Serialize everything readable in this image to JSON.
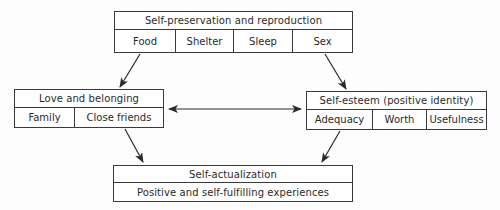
{
  "diagram": {
    "nodes": {
      "top": {
        "title": "Self-preservation and reproduction",
        "items": [
          "Food",
          "Shelter",
          "Sleep",
          "Sex"
        ]
      },
      "left": {
        "title": "Love and belonging",
        "items": [
          "Family",
          "Close friends"
        ]
      },
      "right": {
        "title": "Self-esteem (positive identity)",
        "items": [
          "Adequacy",
          "Worth",
          "Usefulness"
        ]
      },
      "bottom": {
        "title": "Self-actualization",
        "subtitle": "Positive and self-fulfilling experiences"
      }
    },
    "edges": [
      {
        "from": "top",
        "to": "left",
        "type": "directed"
      },
      {
        "from": "top",
        "to": "right",
        "type": "directed"
      },
      {
        "from": "left",
        "to": "right",
        "type": "bidirectional"
      },
      {
        "from": "left",
        "to": "bottom",
        "type": "directed"
      },
      {
        "from": "right",
        "to": "bottom",
        "type": "directed"
      }
    ]
  }
}
